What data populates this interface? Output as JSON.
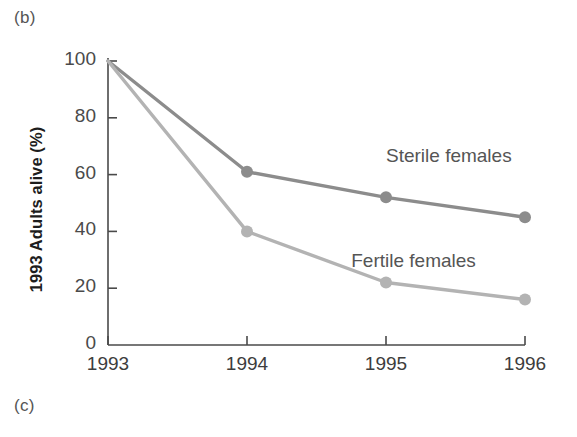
{
  "figure": {
    "panel_label_b": "(b)",
    "panel_label_c": "(c)"
  },
  "chart_data": {
    "type": "line",
    "title": "",
    "xlabel": "",
    "ylabel": "1993 Adults alive (%)",
    "categories": [
      "1993",
      "1994",
      "1995",
      "1996"
    ],
    "x": [
      1993,
      1994,
      1995,
      1996
    ],
    "xlim": [
      1993,
      1996
    ],
    "ylim": [
      0,
      100
    ],
    "yticks": [
      0,
      20,
      40,
      60,
      80,
      100
    ],
    "ytick_labels": [
      "0",
      "20",
      "40",
      "60",
      "80",
      "100"
    ],
    "xticks": [
      1993,
      1994,
      1995,
      1996
    ],
    "xtick_labels": [
      "1993",
      "1994",
      "1995",
      "1996"
    ],
    "grid": false,
    "legend_position": "inline-annotations",
    "series": [
      {
        "name": "Sterile females",
        "values": [
          100,
          61,
          52,
          45
        ],
        "color": "#8c8c8c",
        "marker": "circle",
        "annotation": "Sterile females"
      },
      {
        "name": "Fertile females",
        "values": [
          100,
          40,
          22,
          16
        ],
        "color": "#b3b3b3",
        "marker": "circle",
        "annotation": "Fertile females"
      }
    ],
    "annotations": [
      {
        "text": "Sterile females",
        "x": 1995.0,
        "y": 66
      },
      {
        "text": "Fertile females",
        "x": 1994.75,
        "y": 29
      }
    ],
    "axis_color": "#4a4a4a"
  }
}
